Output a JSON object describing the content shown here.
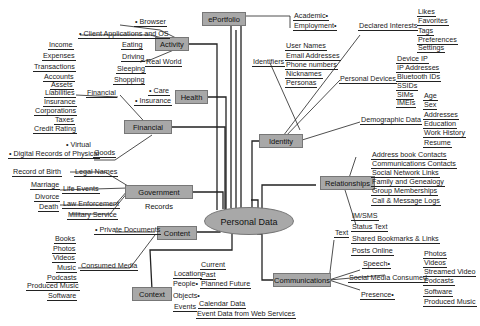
{
  "center": {
    "label": "Personal Data"
  },
  "nodes": {
    "eportfolio": "ePortfolio",
    "activity": "Activity",
    "health": "Health",
    "financial": "Financial",
    "government": "Government Records",
    "content": "Content",
    "context": "Context",
    "identity": "Identity",
    "relationships": "Relationships",
    "communications": "Communications"
  },
  "eportfolio": {
    "items": [
      "Academic•",
      "Employment•"
    ]
  },
  "activity": {
    "browser": "• Browser",
    "client_apps": "• Client Applications and OS",
    "real_world": {
      "label": "Real World",
      "items": [
        "Eating",
        "Driving",
        "Sleeping",
        "Shopping"
      ]
    }
  },
  "health": {
    "items": [
      "• Care",
      "• Insurance"
    ]
  },
  "financial": {
    "financial_branch": {
      "label": "Financial",
      "items": [
        "Income",
        "Expenses",
        "Transactions",
        "Accounts",
        "Assets",
        "Liabilities",
        "Insurance",
        "Corporations",
        "Taxes",
        "Credit Rating"
      ]
    },
    "goods": {
      "label": "Goods",
      "items": [
        "• Virtual",
        "• Digital Records of Physical"
      ]
    }
  },
  "government": {
    "legal_names": "Legal Names",
    "life_events": {
      "label": "Life Events",
      "items": [
        "Record of Birth",
        "Marriage",
        "Divorce",
        "Death"
      ]
    },
    "law_enforcement": "Law Enforcement",
    "military": "Military Service"
  },
  "content": {
    "private_documents": "• Private Documents",
    "consumed_media": {
      "label": "Consumed Media",
      "items": [
        "Books",
        "Photos",
        "Videos",
        "Music",
        "Podcasts",
        "Produced Music",
        "Software"
      ]
    }
  },
  "context": {
    "location": {
      "label": "Location",
      "items": [
        "Current",
        "Past",
        "Planned Future"
      ]
    },
    "people": "People•",
    "objects": "Objects•",
    "events": {
      "label": "Events",
      "items": [
        "Calendar Data",
        "Event Data from Web Services"
      ]
    }
  },
  "identity": {
    "identifiers": {
      "label": "Identifiers",
      "items": [
        "User Names",
        "Email Addresses",
        "Phone numbers",
        "Nicknames",
        "Personas"
      ]
    },
    "declared_interests": {
      "label": "Declared Interests",
      "items": [
        "Likes",
        "Favorites",
        "Tags",
        "Preferences",
        "Settings"
      ]
    },
    "personal_devices": {
      "label": "Personal Devices",
      "items": [
        "Device IP",
        "IP Addresses",
        "Bluetooth IDs",
        "SSIDs",
        "SIMs",
        "IMEIs"
      ]
    },
    "demographic": {
      "label": "Demographic Data",
      "items": [
        "Age",
        "Sex",
        "Addresses",
        "Education",
        "Work History",
        "Resume"
      ]
    }
  },
  "relationships": {
    "items": [
      "Address book Contacts",
      "Communications Contacts",
      "Social Network Links",
      "Family and Genealogy",
      "Group Memberships",
      "Call & Message Logs"
    ]
  },
  "communications": {
    "text": {
      "label": "Text",
      "items": [
        "IM/SMS",
        "Status Text",
        "Shared Bookmarks & Links",
        "Posts Online"
      ]
    },
    "speech": "Speech•",
    "social_media": {
      "label": "Social Media Consumed",
      "items": [
        "Photos",
        "Videos",
        "Streamed Video",
        "Podcasts",
        "Software",
        "Produced Music"
      ]
    },
    "presence": "Presence•"
  }
}
